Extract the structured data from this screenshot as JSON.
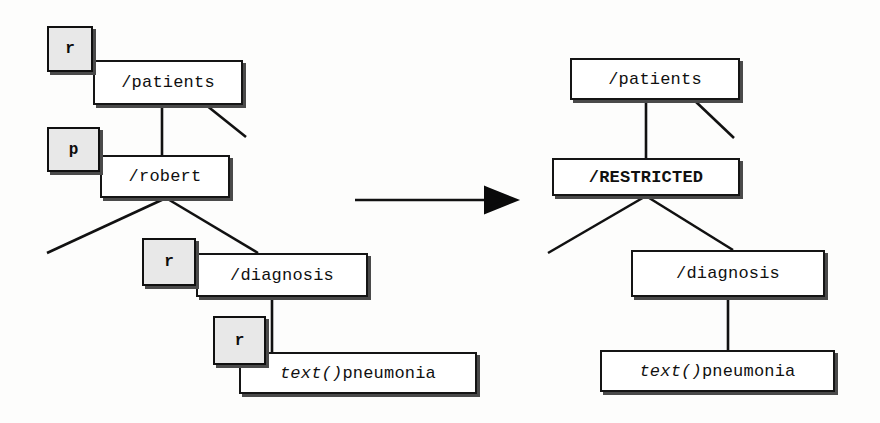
{
  "diagram": {
    "colors": {
      "node_fill": "#ffffff",
      "node_border": "#151515",
      "badge_fill": "#e8e8e8",
      "shadow": "#4a4a4a",
      "edge": "#111111",
      "arrow": "#0a0a0a"
    },
    "left_tree": {
      "name": "original-tree",
      "nodes": [
        {
          "id": "l-patients",
          "label": "/patients"
        },
        {
          "id": "l-robert",
          "label": "/robert"
        },
        {
          "id": "l-diagnosis",
          "label": "/diagnosis"
        },
        {
          "id": "l-text",
          "label_italic": "text()",
          "label_plain": "pneumonia"
        }
      ],
      "badges": [
        {
          "id": "l-badge-patients",
          "label": "r",
          "applies_to": "/patients"
        },
        {
          "id": "l-badge-robert",
          "label": "p",
          "applies_to": "/robert"
        },
        {
          "id": "l-badge-diagnosis",
          "label": "r",
          "applies_to": "/diagnosis"
        },
        {
          "id": "l-badge-text",
          "label": "r",
          "applies_to": "text()pneumonia"
        }
      ]
    },
    "right_tree": {
      "name": "transformed-tree",
      "nodes": [
        {
          "id": "r-patients",
          "label": "/patients"
        },
        {
          "id": "r-restricted",
          "label": "/RESTRICTED",
          "bold": true
        },
        {
          "id": "r-diagnosis",
          "label": "/diagnosis"
        },
        {
          "id": "r-text",
          "label_italic": "text()",
          "label_plain": "pneumonia"
        }
      ],
      "badges": []
    },
    "transform_arrow": {
      "name": "transformation-arrow",
      "direction": "right"
    }
  }
}
